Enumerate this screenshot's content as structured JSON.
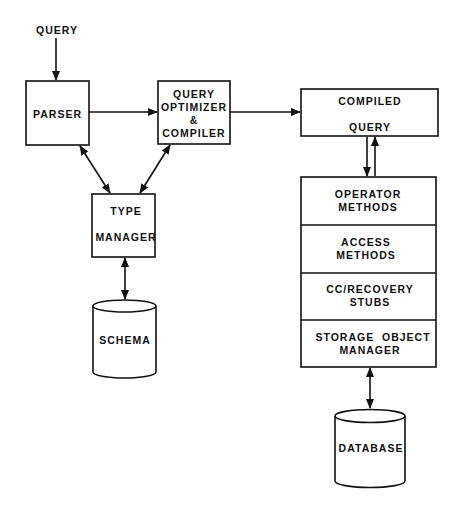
{
  "diagram": {
    "input_label": "QUERY",
    "parser": {
      "label": "PARSER"
    },
    "optimizer": {
      "line1": "QUERY",
      "line2": "OPTIMIZER",
      "line3": "&",
      "line4": "COMPILER"
    },
    "compiled_query": {
      "line1": "COMPILED",
      "line2": "QUERY"
    },
    "type_manager": {
      "line1": "TYPE",
      "line2": "MANAGER"
    },
    "schema": {
      "label": "SCHEMA"
    },
    "runtime_stack": [
      {
        "line1": "OPERATOR",
        "line2": "METHODS"
      },
      {
        "line1": "ACCESS",
        "line2": "METHODS"
      },
      {
        "line1": "CC/RECOVERY",
        "line2": "STUBS"
      },
      {
        "line1": "STORAGE  OBJECT",
        "line2": "MANAGER"
      }
    ],
    "database": {
      "label": "DATABASE"
    }
  }
}
